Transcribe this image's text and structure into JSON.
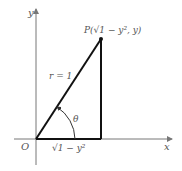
{
  "diagram": {
    "axes": {
      "x_label": "x",
      "y_label": "y",
      "origin_label": "O"
    },
    "point_label": "P(√1 − y², y)",
    "hypotenuse_label": "r = 1",
    "angle_label": "θ",
    "base_label": "√1 − y²",
    "colors": {
      "line": "#111111",
      "axis": "#777777",
      "text": "#555555"
    }
  }
}
